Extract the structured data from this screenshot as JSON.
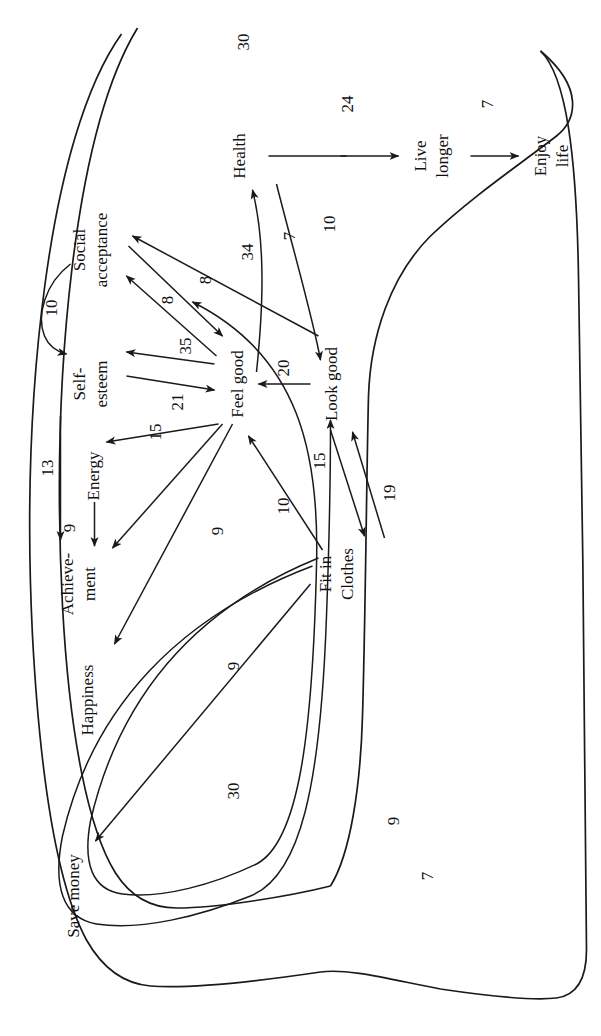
{
  "diagram": {
    "type": "causal-map",
    "orientation": "rotated-90-ccw",
    "ink_color": "#1a1a1a",
    "background_color": "#ffffff",
    "nodes": [
      {
        "id": "save_money",
        "label": "Save money",
        "x": 140,
        "y": 78
      },
      {
        "id": "happiness",
        "label": "Happiness",
        "x": 336,
        "y": 92
      },
      {
        "id": "achievement",
        "label": "Achieve-\nment",
        "x": 452,
        "y": 80
      },
      {
        "id": "achievement_l1",
        "label": "Achieve-",
        "x": 452,
        "y": 72
      },
      {
        "id": "achievement_l2",
        "label": "ment",
        "x": 452,
        "y": 94
      },
      {
        "id": "energy",
        "label": "Energy",
        "x": 560,
        "y": 92
      },
      {
        "id": "self_esteem_l1",
        "label": "Self-",
        "x": 652,
        "y": 84
      },
      {
        "id": "self_esteem_l2",
        "label": "esteem",
        "x": 652,
        "y": 106
      },
      {
        "id": "social_l1",
        "label": "Social",
        "x": 780,
        "y": 84
      },
      {
        "id": "social_l2",
        "label": "acceptance",
        "x": 780,
        "y": 106
      },
      {
        "id": "feel_good",
        "label": "Feel good",
        "x": 652,
        "y": 236
      },
      {
        "id": "look_good",
        "label": "Look good",
        "x": 652,
        "y": 330
      },
      {
        "id": "fit_l1",
        "label": "Fit in",
        "x": 462,
        "y": 330
      },
      {
        "id": "fit_l2",
        "label": "Clothes",
        "x": 462,
        "y": 352
      },
      {
        "id": "health",
        "label": "Health",
        "x": 880,
        "y": 238
      },
      {
        "id": "live_l1",
        "label": "Live",
        "x": 880,
        "y": 425
      },
      {
        "id": "live_l2",
        "label": "longer",
        "x": 880,
        "y": 447
      },
      {
        "id": "enjoy_l1",
        "label": "Enjoy",
        "x": 880,
        "y": 545
      },
      {
        "id": "enjoy_l2",
        "label": "life",
        "x": 880,
        "y": 567
      }
    ],
    "edges": [
      {
        "id": "e1",
        "from": "Fit in Clothes",
        "to": "Save money",
        "weight": "30"
      },
      {
        "id": "e2",
        "from": "Fit in Clothes",
        "to": "Self-esteem",
        "weight": "7"
      },
      {
        "id": "e3",
        "from": "Fit in Clothes",
        "to": "Social acceptance",
        "weight": "9"
      },
      {
        "id": "e4",
        "from": "Fit in Clothes",
        "to": "Feel good",
        "weight": "10"
      },
      {
        "id": "e5",
        "from": "Fit in Clothes",
        "to": "Look good",
        "weight": "15"
      },
      {
        "id": "e6",
        "from": "Look good",
        "to": "Fit in Clothes",
        "weight": "19"
      },
      {
        "id": "e7",
        "from": "Feel good",
        "to": "Happiness",
        "weight": "9"
      },
      {
        "id": "e8",
        "from": "Feel good",
        "to": "Achievement",
        "weight": "9"
      },
      {
        "id": "e9",
        "from": "Self-esteem",
        "to": "Achievement",
        "weight": "13"
      },
      {
        "id": "e10",
        "from": "Energy",
        "to": "Achievement",
        "weight": "9"
      },
      {
        "id": "e11",
        "from": "Feel good",
        "to": "Energy",
        "weight": "15"
      },
      {
        "id": "e12",
        "from": "Self-esteem",
        "to": "Feel good",
        "weight": "21"
      },
      {
        "id": "e13",
        "from": "Feel good",
        "to": "Self-esteem",
        "weight": "35"
      },
      {
        "id": "e14",
        "from": "Feel good",
        "to": "Social acceptance",
        "weight": "8"
      },
      {
        "id": "e15",
        "from": "Social acceptance",
        "to": "Feel good",
        "weight": "8"
      },
      {
        "id": "e16",
        "from": "Look good",
        "to": "Social acceptance",
        "weight": "34"
      },
      {
        "id": "e17",
        "from": "Look good",
        "to": "Feel good",
        "weight": "20"
      },
      {
        "id": "e18",
        "from": "Social acceptance",
        "to": "Self-esteem",
        "weight": "10"
      },
      {
        "id": "e19",
        "from": "Feel good",
        "to": "Health",
        "weight": "7"
      },
      {
        "id": "e20",
        "from": "Health",
        "to": "Look good",
        "weight": "10"
      },
      {
        "id": "e21",
        "from": "Health",
        "to": "Live longer",
        "weight": "24"
      },
      {
        "id": "e22",
        "from": "Live longer",
        "to": "Enjoy life",
        "weight": "7"
      },
      {
        "id": "e23",
        "from": "outer-boundary",
        "to": "outer-boundary",
        "weight": "30"
      }
    ],
    "weight_labels": [
      {
        "id": "w30a",
        "text": "30",
        "x": 245,
        "y": 238
      },
      {
        "id": "w7a",
        "text": "7",
        "x": 160,
        "y": 432
      },
      {
        "id": "w9a",
        "text": "9",
        "x": 215,
        "y": 398
      },
      {
        "id": "w9b",
        "text": "9",
        "x": 370,
        "y": 238
      },
      {
        "id": "w9c",
        "text": "9",
        "x": 505,
        "y": 222
      },
      {
        "id": "w10a",
        "text": "10",
        "x": 530,
        "y": 288
      },
      {
        "id": "w15a",
        "text": "15",
        "x": 575,
        "y": 320
      },
      {
        "id": "w19a",
        "text": "19",
        "x": 543,
        "y": 394
      },
      {
        "id": "w13",
        "text": "13",
        "x": 568,
        "y": 55
      },
      {
        "id": "w9d",
        "text": "9",
        "x": 505,
        "y": 107
      },
      {
        "id": "w15b",
        "text": "15",
        "x": 598,
        "y": 165
      },
      {
        "id": "w21",
        "text": "21",
        "x": 640,
        "y": 180
      },
      {
        "id": "w35",
        "text": "35",
        "x": 686,
        "y": 188
      },
      {
        "id": "w20",
        "text": "20",
        "x": 655,
        "y": 290
      },
      {
        "id": "w8a",
        "text": "8",
        "x": 740,
        "y": 175
      },
      {
        "id": "w8b",
        "text": "8",
        "x": 755,
        "y": 212
      },
      {
        "id": "w34",
        "text": "34",
        "x": 782,
        "y": 250
      },
      {
        "id": "w10b",
        "text": "10",
        "x": 728,
        "y": 60
      },
      {
        "id": "w7b",
        "text": "7",
        "x": 800,
        "y": 290
      },
      {
        "id": "w10c",
        "text": "10",
        "x": 810,
        "y": 330
      },
      {
        "id": "w24",
        "text": "24",
        "x": 930,
        "y": 350
      },
      {
        "id": "w7c",
        "text": "7",
        "x": 930,
        "y": 490
      },
      {
        "id": "w30b",
        "text": "30",
        "x": 992,
        "y": 245
      }
    ]
  }
}
